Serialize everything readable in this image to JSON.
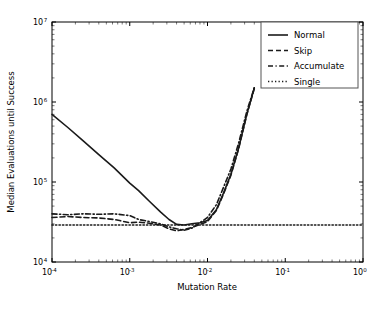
{
  "chart_data": {
    "type": "line",
    "title": "",
    "xlabel": "Mutation Rate",
    "ylabel": "Median Evaluations until Success",
    "xscale": "log",
    "yscale": "log",
    "xlim": [
      0.0001,
      1.0
    ],
    "ylim": [
      10000,
      10000000
    ],
    "grid": false,
    "legend_position": "upper right",
    "xticks": [
      {
        "value": 0.0001,
        "label": "10",
        "exp": "-4"
      },
      {
        "value": 0.001,
        "label": "10",
        "exp": "-3"
      },
      {
        "value": 0.01,
        "label": "10",
        "exp": "-2"
      },
      {
        "value": 0.1,
        "label": "10",
        "exp": "-1"
      },
      {
        "value": 1.0,
        "label": "10",
        "exp": "0"
      }
    ],
    "yticks": [
      {
        "value": 10000,
        "label": "10",
        "exp": "4"
      },
      {
        "value": 100000,
        "label": "10",
        "exp": "5"
      },
      {
        "value": 1000000,
        "label": "10",
        "exp": "6"
      },
      {
        "value": 10000000,
        "label": "10",
        "exp": "7"
      }
    ],
    "series": [
      {
        "name": "Normal",
        "style": "solid",
        "color": "#1a1a1a",
        "x": [
          0.0001,
          0.00016,
          0.00025,
          0.0004,
          0.00063,
          0.001,
          0.0013,
          0.0018,
          0.0025,
          0.0032,
          0.004,
          0.005,
          0.0063,
          0.008,
          0.01,
          0.013,
          0.016,
          0.02,
          0.025,
          0.032,
          0.04
        ],
        "y": [
          700000,
          480000,
          330000,
          220000,
          150000,
          97000,
          78000,
          57000,
          42000,
          34000,
          29500,
          29000,
          30000,
          31000,
          33000,
          45000,
          72000,
          125000,
          260000,
          700000,
          1500000
        ]
      },
      {
        "name": "Skip",
        "style": "dashed",
        "color": "#1a1a1a",
        "x": [
          0.0001,
          0.00016,
          0.00025,
          0.0004,
          0.00063,
          0.001,
          0.0013,
          0.0018,
          0.0025,
          0.0032,
          0.004,
          0.005,
          0.0063,
          0.008,
          0.01,
          0.013,
          0.016,
          0.02,
          0.025,
          0.032,
          0.04
        ],
        "y": [
          36000,
          37000,
          36000,
          35500,
          34000,
          31000,
          31500,
          30500,
          29000,
          26000,
          24500,
          25500,
          27000,
          29500,
          32000,
          44000,
          70000,
          122000,
          255000,
          690000,
          1480000
        ]
      },
      {
        "name": "Accumulate",
        "style": "dashdot",
        "color": "#1a1a1a",
        "x": [
          0.0001,
          0.00016,
          0.00025,
          0.0004,
          0.00063,
          0.001,
          0.0013,
          0.0018,
          0.0025,
          0.0032,
          0.004,
          0.005,
          0.0063,
          0.008,
          0.01,
          0.013,
          0.016,
          0.02,
          0.025,
          0.032,
          0.04
        ],
        "y": [
          40000,
          39000,
          40000,
          39500,
          40000,
          38000,
          34000,
          32000,
          30000,
          27500,
          26000,
          25000,
          26500,
          31000,
          36000,
          52000,
          85000,
          145000,
          300000,
          760000,
          1520000
        ]
      },
      {
        "name": "Single",
        "style": "dotted",
        "color": "#1a1a1a",
        "x": [
          0.0001,
          1.0
        ],
        "y": [
          29000,
          29000
        ]
      }
    ]
  },
  "legend": {
    "entries": [
      {
        "label": "Normal"
      },
      {
        "label": "Skip"
      },
      {
        "label": "Accumulate"
      },
      {
        "label": "Single"
      }
    ]
  }
}
